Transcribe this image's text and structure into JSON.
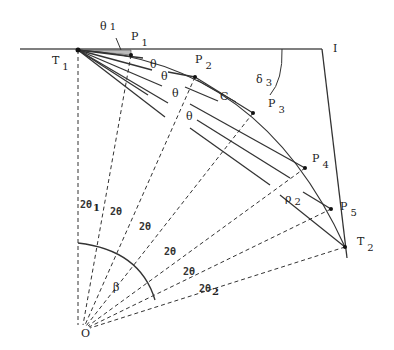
{
  "diagram": {
    "type": "geometry",
    "colors": {
      "stroke": "#222222",
      "dashed": "#333333",
      "background": "#ffffff"
    },
    "points": {
      "T1": {
        "label": "T",
        "sub": "1"
      },
      "T2": {
        "label": "T",
        "sub": "2"
      },
      "I": {
        "label": "I"
      },
      "O": {
        "label": "O"
      },
      "C": {
        "label": "C"
      },
      "P1": {
        "label": "P",
        "sub": "1"
      },
      "P2": {
        "label": "P",
        "sub": "2"
      },
      "P3": {
        "label": "P",
        "sub": "3"
      },
      "P4": {
        "label": "P",
        "sub": "4"
      },
      "P5": {
        "label": "P",
        "sub": "5"
      }
    },
    "angle_labels": {
      "theta1": {
        "label": "θ",
        "sub": "1"
      },
      "theta": "θ",
      "delta3": {
        "label": "δ",
        "sub": "3"
      },
      "rho2": {
        "label": "ρ",
        "sub": "2"
      },
      "beta": "β",
      "two_theta1": {
        "label": "2θ",
        "sub": "1"
      },
      "two_theta": "2θ",
      "two_theta2": {
        "label": "2θ",
        "sub": "2"
      }
    }
  }
}
